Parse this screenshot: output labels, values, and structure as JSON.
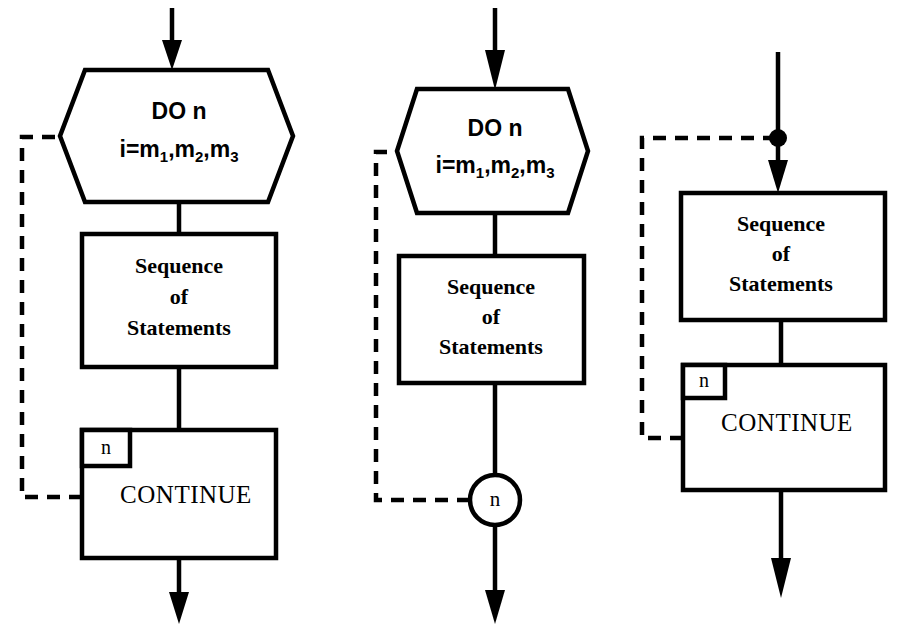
{
  "figure": {
    "background_color": "#ffffff",
    "line_color": "#000000",
    "diagrams": [
      {
        "id": "diagram-do-continue-hexagon",
        "nodes": {
          "hexagon": {
            "line1": "DO n",
            "line2_prefix": "i=m",
            "sub1": "1",
            "sep1": ",m",
            "sub2": "2",
            "sep2": ",m",
            "sub3": "3"
          },
          "process_box": {
            "line1": "Sequence",
            "line2": "of",
            "line3": "Statements"
          },
          "continue_box": {
            "tag": "n",
            "label": "CONTINUE"
          }
        }
      },
      {
        "id": "diagram-do-circle-connector",
        "nodes": {
          "hexagon": {
            "line1": "DO n",
            "line2_prefix": "i=m",
            "sub1": "1",
            "sep1": ",m",
            "sub2": "2",
            "sep2": ",m",
            "sub3": "3"
          },
          "process_box": {
            "line1": "Sequence",
            "line2": "of",
            "line3": "Statements"
          },
          "connector_circle": {
            "label": "n"
          }
        }
      },
      {
        "id": "diagram-junction-continue",
        "nodes": {
          "junction": {
            "label": ""
          },
          "process_box": {
            "line1": "Sequence",
            "line2": "of",
            "line3": "Statements"
          },
          "continue_box": {
            "tag": "n",
            "label": "CONTINUE"
          }
        }
      }
    ]
  }
}
